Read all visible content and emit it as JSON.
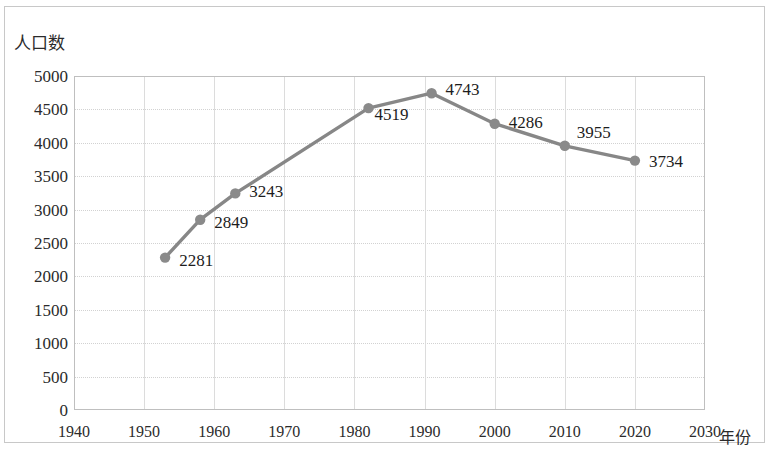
{
  "chart_data": {
    "type": "line",
    "title": "",
    "ylabel": "人口数",
    "xlabel": "年份",
    "xlim": [
      1940,
      2030
    ],
    "ylim": [
      0,
      5000
    ],
    "grid": true,
    "legend": false,
    "line_color": "#878787",
    "marker_color": "#8a8a8a",
    "x": [
      1953,
      1958,
      1963,
      1982,
      1991,
      2000,
      2010,
      2020
    ],
    "values": [
      2281,
      2849,
      3243,
      4519,
      4743,
      4286,
      3955,
      3734
    ],
    "point_labels": [
      "2281",
      "2849",
      "3243",
      "4519",
      "4743",
      "4286",
      "3955",
      "3734"
    ],
    "yticks": [
      "0",
      "500",
      "1000",
      "1500",
      "2000",
      "2500",
      "3000",
      "3500",
      "4000",
      "4500",
      "5000"
    ],
    "ytick_values": [
      0,
      500,
      1000,
      1500,
      2000,
      2500,
      3000,
      3500,
      4000,
      4500,
      5000
    ],
    "xticks": [
      "1940",
      "1950",
      "1960",
      "1970",
      "1980",
      "1990",
      "2000",
      "2010",
      "2020",
      "2030"
    ],
    "xtick_values": [
      1940,
      1950,
      1960,
      1970,
      1980,
      1990,
      2000,
      2010,
      2020,
      2030
    ]
  }
}
